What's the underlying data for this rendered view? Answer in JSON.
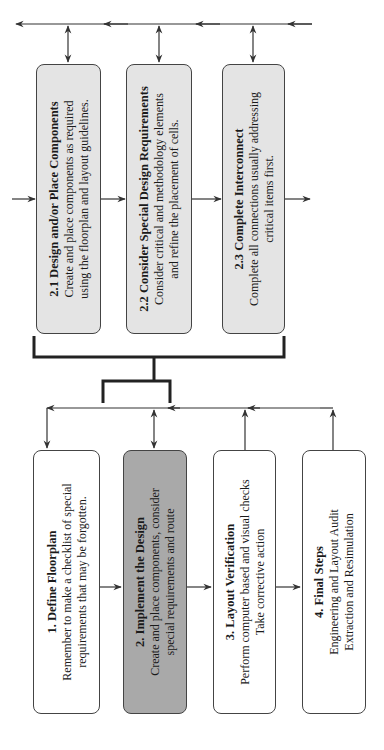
{
  "diagram": {
    "orientation": "rotated 90 degrees counter-clockwise",
    "colors": {
      "substep_fill": "#e4e4e4",
      "active_step_fill": "#a9a9a9",
      "step_fill": "#ffffff",
      "line": "#333333"
    },
    "main_steps": [
      {
        "title": "1. Define Floorplan",
        "lines": [
          "Remember to make a checklist of special",
          "requirements that may be forgotten."
        ]
      },
      {
        "title": "2. Implement the Design",
        "lines": [
          "Create and place components, consider",
          "special requirements and route"
        ]
      },
      {
        "title": "3. Layout Verification",
        "lines": [
          "Perform computer based and visual checks",
          "Take corrective action"
        ]
      },
      {
        "title": "4. Final Steps",
        "lines": [
          "Engineering and Layout Audit",
          "Extraction and Resimulation"
        ]
      }
    ],
    "sub_steps": [
      {
        "title": "2.1 Design and/or Place Components",
        "lines": [
          "Create and place components as required",
          "using the floorplan and layout guidelines."
        ]
      },
      {
        "title": "2.2 Consider Special Design Requirements",
        "lines": [
          "Consider critical and methodology elements",
          "and refine the placement of cells."
        ]
      },
      {
        "title": "2.3 Complete Interconnect",
        "lines": [
          "Complete all connections usually addressing",
          "critical items first."
        ]
      }
    ]
  }
}
